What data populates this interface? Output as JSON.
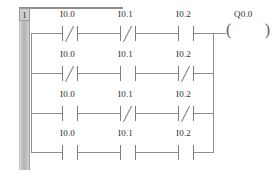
{
  "diagram": {
    "type": "plc-ladder-logic",
    "network_label": "1",
    "coil_label": "Q0.0",
    "columns": [
      {
        "name": "column-1",
        "x": 62
      },
      {
        "name": "column-2",
        "x": 120
      },
      {
        "name": "column-3",
        "x": 178
      }
    ],
    "rungs": [
      {
        "name": "rung-1",
        "y": 33,
        "contacts": [
          {
            "label": "I0.0",
            "kind": "normally-closed"
          },
          {
            "label": "I0.1",
            "kind": "normally-closed"
          },
          {
            "label": "I0.2",
            "kind": "normally-open"
          }
        ]
      },
      {
        "name": "rung-2",
        "y": 73,
        "contacts": [
          {
            "label": "I0.0",
            "kind": "normally-closed"
          },
          {
            "label": "I0.1",
            "kind": "normally-open"
          },
          {
            "label": "I0.2",
            "kind": "normally-closed"
          }
        ]
      },
      {
        "name": "rung-3",
        "y": 113,
        "contacts": [
          {
            "label": "I0.0",
            "kind": "normally-open"
          },
          {
            "label": "I0.1",
            "kind": "normally-closed"
          },
          {
            "label": "I0.2",
            "kind": "normally-closed"
          }
        ]
      },
      {
        "name": "rung-4",
        "y": 152,
        "contacts": [
          {
            "label": "I0.0",
            "kind": "normally-open"
          },
          {
            "label": "I0.1",
            "kind": "normally-open"
          },
          {
            "label": "I0.2",
            "kind": "normally-open"
          }
        ]
      }
    ],
    "colors": {
      "rail": "#b4b4b4",
      "wire": "#8f8f8f",
      "glyph": "#7d7d7d",
      "text": "#2e2e2e",
      "background": "#ffffff"
    }
  }
}
